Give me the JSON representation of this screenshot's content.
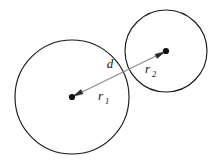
{
  "diagram": {
    "background_color": "#ffffff",
    "outline_color": "#1a1a1a",
    "line_color": "#8a8a8a",
    "dot_color": "#111111",
    "labels": {
      "distance": "d",
      "radius_one": "r",
      "radius_one_sub": "1",
      "radius_two": "r",
      "radius_two_sub": "2"
    },
    "shapes": {
      "circle_left": {
        "cx": 72,
        "cy": 97,
        "r": 57
      },
      "circle_right": {
        "cx": 166,
        "cy": 51,
        "r": 41
      }
    },
    "connector": {
      "from_x": 72,
      "from_y": 97,
      "to_x": 166,
      "to_y": 51,
      "arrowheads": "both"
    },
    "label_positions": {
      "d": {
        "x": 110,
        "y": 68
      },
      "r1": {
        "x": 98,
        "y": 100
      },
      "r2": {
        "x": 145,
        "y": 73
      }
    }
  }
}
